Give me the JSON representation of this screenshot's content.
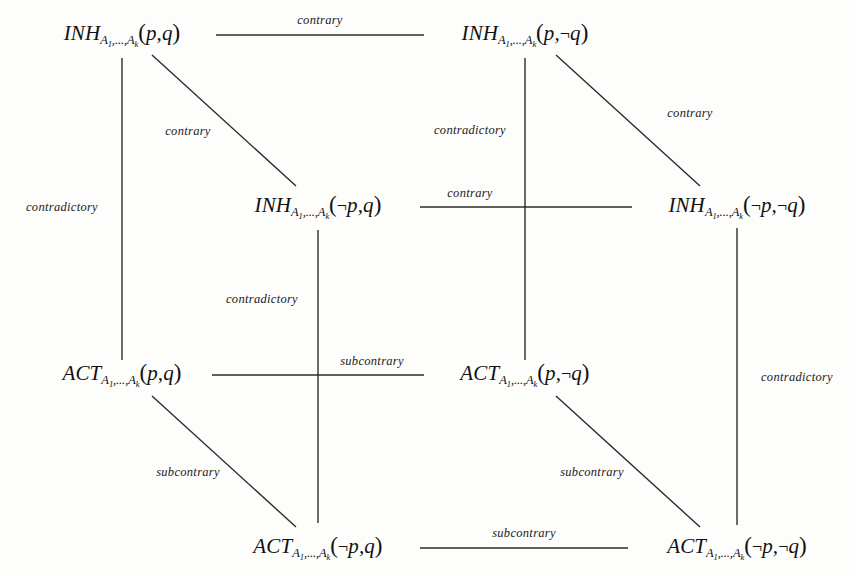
{
  "diagram": {
    "type": "logic-opposition-cube",
    "line_color": "#2b2b2b",
    "text_color": "#111111",
    "background": "#fdfdfc",
    "subscript": "A",
    "subscript_index_1": "1",
    "subscript_index_k": "k",
    "ellipsis": ",...,",
    "negation_symbol": "¬",
    "open_paren": "(",
    "close_paren": ")",
    "comma": ",",
    "nodes": [
      {
        "id": "inh-p-q",
        "operator": "INH",
        "arg1": "p",
        "arg2": "q",
        "full_text": "INH_{A1,...,Ak}(p,q)",
        "x": 122,
        "y": 35
      },
      {
        "id": "inh-p-notq",
        "operator": "INH",
        "arg1": "p",
        "arg2": "¬q",
        "full_text": "INH_{A1,...,Ak}(p,¬q)",
        "x": 525,
        "y": 35
      },
      {
        "id": "inh-notp-q",
        "operator": "INH",
        "arg1": "¬p",
        "arg2": "q",
        "full_text": "INH_{A1,...,Ak}(¬p,q)",
        "x": 318,
        "y": 207
      },
      {
        "id": "inh-notp-notq",
        "operator": "INH",
        "arg1": "¬p",
        "arg2": "¬q",
        "full_text": "INH_{A1,...,Ak}(¬p,¬q)",
        "x": 737,
        "y": 207
      },
      {
        "id": "act-p-q",
        "operator": "ACT",
        "arg1": "p",
        "arg2": "q",
        "full_text": "ACT_{A1,...,Ak}(p,q)",
        "x": 122,
        "y": 375
      },
      {
        "id": "act-p-notq",
        "operator": "ACT",
        "arg1": "p",
        "arg2": "¬q",
        "full_text": "ACT_{A1,...,Ak}(p,¬q)",
        "x": 525,
        "y": 375
      },
      {
        "id": "act-notp-q",
        "operator": "ACT",
        "arg1": "¬p",
        "arg2": "q",
        "full_text": "ACT_{A1,...,Ak}(¬p,q)",
        "x": 318,
        "y": 548
      },
      {
        "id": "act-notp-notq",
        "operator": "ACT",
        "arg1": "¬p",
        "arg2": "¬q",
        "full_text": "ACT_{A1,...,Ak}(¬p,¬q)",
        "x": 737,
        "y": 548
      }
    ],
    "edges": [
      {
        "id": "e-top-horizontal",
        "from": "inh-p-q",
        "to": "inh-p-notq",
        "relation": "contrary",
        "x1": 216,
        "y1": 35,
        "x2": 424,
        "y2": 35,
        "label_x": 320,
        "label_y": 20
      },
      {
        "id": "e-middle-horizontal",
        "from": "inh-notp-q",
        "to": "inh-notp-notq",
        "relation": "contrary",
        "x1": 420,
        "y1": 207,
        "x2": 632,
        "y2": 207,
        "label_x": 470,
        "label_y": 193
      },
      {
        "id": "e-act-horizontal",
        "from": "act-p-q",
        "to": "act-p-notq",
        "relation": "subcontrary",
        "x1": 212,
        "y1": 375,
        "x2": 424,
        "y2": 375,
        "label_x": 372,
        "label_y": 361
      },
      {
        "id": "e-bottom-horizontal",
        "from": "act-notp-q",
        "to": "act-notp-notq",
        "relation": "subcontrary",
        "x1": 420,
        "y1": 548,
        "x2": 628,
        "y2": 548,
        "label_x": 524,
        "label_y": 533
      },
      {
        "id": "e-left-vertical",
        "from": "inh-p-q",
        "to": "act-p-q",
        "relation": "contradictory",
        "x1": 122,
        "y1": 58,
        "x2": 122,
        "y2": 360,
        "label_x": 62,
        "label_y": 207
      },
      {
        "id": "e-center-vertical",
        "from": "inh-p-notq",
        "to": "act-p-notq",
        "relation": "contradictory",
        "x1": 525,
        "y1": 58,
        "x2": 525,
        "y2": 360,
        "label_x": 470,
        "label_y": 130
      },
      {
        "id": "e-inner-vertical",
        "from": "inh-notp-q",
        "to": "act-notp-q",
        "relation": "contradictory",
        "x1": 318,
        "y1": 230,
        "x2": 318,
        "y2": 523,
        "label_x": 262,
        "label_y": 299
      },
      {
        "id": "e-right-vertical",
        "from": "inh-notp-notq",
        "to": "act-notp-notq",
        "relation": "contradictory",
        "x1": 737,
        "y1": 228,
        "x2": 737,
        "y2": 525,
        "label_x": 797,
        "label_y": 377
      },
      {
        "id": "e-diagonal-top-left",
        "from": "inh-p-q",
        "to": "inh-notp-q",
        "relation": "contrary",
        "x1": 152,
        "y1": 55,
        "x2": 296,
        "y2": 186,
        "label_x": 188,
        "label_y": 131
      },
      {
        "id": "e-diagonal-top-right",
        "from": "inh-p-notq",
        "to": "inh-notp-notq",
        "relation": "contrary",
        "x1": 556,
        "y1": 55,
        "x2": 700,
        "y2": 186,
        "label_x": 690,
        "label_y": 113
      },
      {
        "id": "e-diagonal-bottom-left",
        "from": "act-p-q",
        "to": "act-notp-q",
        "relation": "subcontrary",
        "x1": 152,
        "y1": 396,
        "x2": 296,
        "y2": 527,
        "label_x": 188,
        "label_y": 472
      },
      {
        "id": "e-diagonal-bottom-right",
        "from": "act-p-notq",
        "to": "act-notp-notq",
        "relation": "subcontrary",
        "x1": 556,
        "y1": 396,
        "x2": 700,
        "y2": 527,
        "label_x": 592,
        "label_y": 472
      }
    ]
  }
}
